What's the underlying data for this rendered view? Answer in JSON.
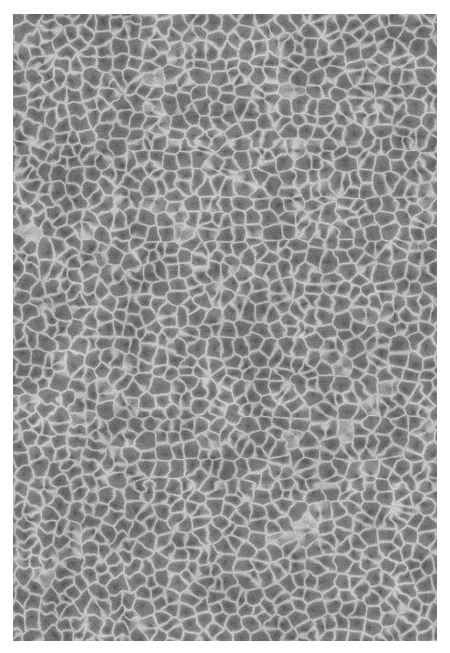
{
  "page": {
    "background_color": "#ffffff",
    "width": 450,
    "height": 653
  },
  "figure": {
    "kind": "micrograph",
    "has_text": false,
    "has_scale_bar": false,
    "has_axes": false,
    "has_caption": false,
    "plate": {
      "left": 13,
      "top": 14,
      "width": 424,
      "height": 627,
      "border": "none"
    },
    "appearance": {
      "mean_gray": "#7a7a7a",
      "ridge_highlight": "#b8b8b8",
      "grain_core_shadow": "#4a4a4a",
      "darkest": "#3c3c3c",
      "lightest": "#c8c8c8",
      "grain_diameter_px": 14,
      "ridge_width_px": 2,
      "dither": "fine halftone checker",
      "noise_amount": 22
    }
  }
}
